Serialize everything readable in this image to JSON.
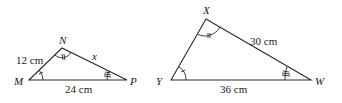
{
  "figure": {
    "triangle_small": {
      "name": "MNP",
      "vertices": {
        "M": "M",
        "N": "N",
        "P": "P"
      },
      "sides": {
        "MN": "12 cm",
        "NP": "x",
        "MP": "24 cm"
      },
      "angle_marks": {
        "M": "single-arc-one-tick",
        "N": "single-arc-double-tick",
        "P": "single-arc-triple-tick"
      }
    },
    "triangle_large": {
      "name": "XYW",
      "vertices": {
        "X": "X",
        "Y": "Y",
        "W": "W"
      },
      "sides": {
        "XW": "30 cm",
        "YW": "36 cm"
      },
      "angle_marks": {
        "Y": "single-arc-one-tick",
        "X": "single-arc-double-tick",
        "W": "single-arc-triple-tick"
      }
    },
    "colors": {
      "stroke": "#2a2a2a",
      "text": "#1a1a1a",
      "background": "#ffffff"
    }
  }
}
